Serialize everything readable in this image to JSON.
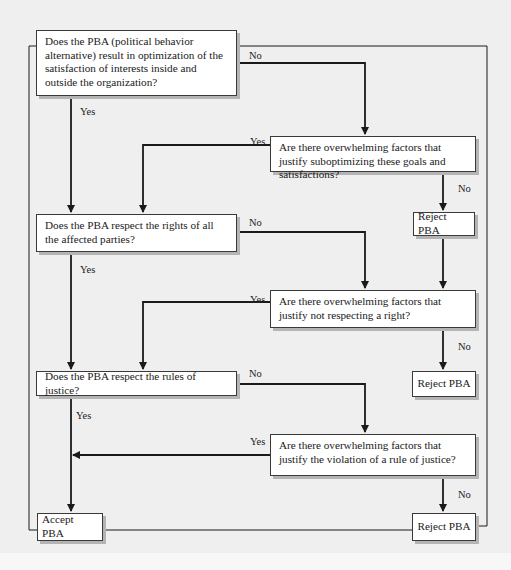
{
  "diagram": {
    "type": "flowchart",
    "nodes": [
      {
        "id": "q1",
        "kind": "decision",
        "text": "Does the PBA (political behavior alternative) result in optimization of the satisfaction of interests inside and outside the organization?"
      },
      {
        "id": "q1b",
        "kind": "decision",
        "text": "Are there overwhelming factors that justify suboptimizing these goals and satisfactions?"
      },
      {
        "id": "r1",
        "kind": "terminal",
        "text": "Reject PBA"
      },
      {
        "id": "q2",
        "kind": "decision",
        "text": "Does the PBA respect the rights of all the affected parties?"
      },
      {
        "id": "q2b",
        "kind": "decision",
        "text": "Are there overwhelming factors that justify not respecting a right?"
      },
      {
        "id": "r2",
        "kind": "terminal",
        "text": "Reject PBA"
      },
      {
        "id": "q3",
        "kind": "decision",
        "text": "Does the PBA respect the rules of justice?"
      },
      {
        "id": "q3b",
        "kind": "decision",
        "text": "Are there overwhelming factors that justify the violation of a rule of justice?"
      },
      {
        "id": "r3",
        "kind": "terminal",
        "text": "Reject PBA"
      },
      {
        "id": "accept",
        "kind": "terminal",
        "text": "Accept PBA"
      }
    ],
    "edges": [
      {
        "from": "q1",
        "to": "q2",
        "label": "Yes"
      },
      {
        "from": "q1",
        "to": "q1b",
        "label": "No"
      },
      {
        "from": "q1b",
        "to": "q2",
        "label": "Yes"
      },
      {
        "from": "q1b",
        "to": "r1",
        "label": "No"
      },
      {
        "from": "r1",
        "to": "q2b",
        "label": ""
      },
      {
        "from": "q2",
        "to": "q3",
        "label": "Yes"
      },
      {
        "from": "q2",
        "to": "q2b",
        "label": "No"
      },
      {
        "from": "q2b",
        "to": "q3",
        "label": "Yes"
      },
      {
        "from": "q2b",
        "to": "r2",
        "label": "No"
      },
      {
        "from": "q3",
        "to": "accept",
        "label": "Yes"
      },
      {
        "from": "q3",
        "to": "q3b",
        "label": "No"
      },
      {
        "from": "q3b",
        "to": "accept",
        "label": "Yes"
      },
      {
        "from": "q3b",
        "to": "r3",
        "label": "No"
      }
    ]
  },
  "labels": {
    "yes": "Yes",
    "no": "No"
  },
  "colors": {
    "background": "#efefef",
    "box_fill": "#ffffff",
    "line": "#1a1a1a",
    "shadow": "#b4b4b4"
  }
}
